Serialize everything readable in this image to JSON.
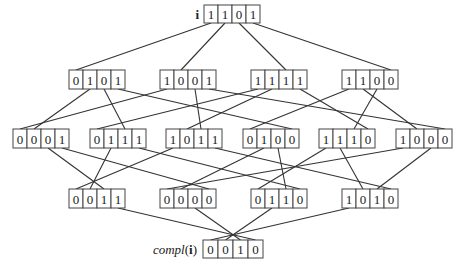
{
  "diagram": {
    "title_label": "i",
    "bottom_label_prefix": "compl",
    "bottom_label_arg": "i",
    "levels": [
      [
        "1101"
      ],
      [
        "0101",
        "1001",
        "1111",
        "1100"
      ],
      [
        "0001",
        "0111",
        "1011",
        "0100",
        "1110",
        "1000"
      ],
      [
        "0011",
        "0000",
        "0110",
        "1010"
      ],
      [
        "0010"
      ]
    ],
    "edges": "hamming-distance-1 between adjacent levels"
  }
}
